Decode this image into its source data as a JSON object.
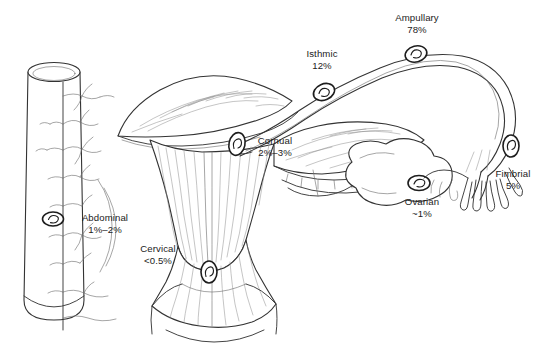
{
  "figure": {
    "type": "anatomical-diagram",
    "background_color": "#ffffff",
    "line_color": "#333333",
    "text_color": "#1b1b1b"
  },
  "labels": [
    {
      "key": "ampullary",
      "name": "Ampullary",
      "value": "78%"
    },
    {
      "key": "isthmic",
      "name": "Isthmic",
      "value": "12%"
    },
    {
      "key": "cornual",
      "name": "Cornual",
      "value": "2%–3%"
    },
    {
      "key": "fimbrial",
      "name": "Fimbrial",
      "value": "5%"
    },
    {
      "key": "ovarian",
      "name": "Ovarian",
      "value": "~1%"
    },
    {
      "key": "abdominal",
      "name": "Abdominal",
      "value": "1%–2%"
    },
    {
      "key": "cervical",
      "name": "Cervical",
      "value": "<0.5%"
    }
  ],
  "structures": [
    {
      "key": "bowel",
      "name": "Bowel segment with mesentery"
    },
    {
      "key": "uterus",
      "name": "Uterine body"
    },
    {
      "key": "cervix",
      "name": "Cervix"
    },
    {
      "key": "left-broad-ligament",
      "name": "Left broad ligament"
    },
    {
      "key": "right-broad-ligament",
      "name": "Right broad ligament"
    },
    {
      "key": "fallopian-tube",
      "name": "Right fallopian tube"
    },
    {
      "key": "ovary",
      "name": "Right ovary"
    },
    {
      "key": "fimbriae",
      "name": "Fimbriae"
    }
  ],
  "embryo_markers": [
    {
      "key": "marker-ampullary"
    },
    {
      "key": "marker-isthmic"
    },
    {
      "key": "marker-cornual"
    },
    {
      "key": "marker-fimbrial"
    },
    {
      "key": "marker-ovarian"
    },
    {
      "key": "marker-abdominal"
    },
    {
      "key": "marker-cervical"
    }
  ]
}
